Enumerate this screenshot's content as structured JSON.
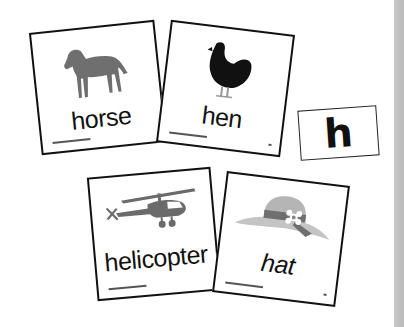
{
  "cards": [
    {
      "word": "horse",
      "picture": "horse-icon",
      "color": "#6f6f6f"
    },
    {
      "word": "hen",
      "picture": "hen-icon",
      "color": "#111111"
    },
    {
      "word": "helicopter",
      "picture": "helicopter-icon",
      "color": "#6b6b6b"
    },
    {
      "word": "hat",
      "picture": "hat-icon",
      "color": "#9a9a9a"
    }
  ],
  "letter_card": {
    "letter": "h"
  },
  "colors": {
    "border": "#111111",
    "strip": "#c0c0c0"
  }
}
